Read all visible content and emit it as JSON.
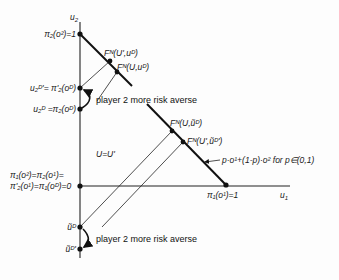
{
  "diagram": {
    "axes": {
      "x_label": "u",
      "x_label_sub": "1",
      "y_label": "u",
      "y_label_sub": "2"
    },
    "y_axis_labels": {
      "top": "π₂(o²)=1",
      "u2D_prime": "u₂ᴰ'= π'₂(oᴰ)",
      "u2D": "u₂ᴰ =π₂(oᴰ)",
      "origin_line1": "π₁(o²)=π₂(o¹)=",
      "origin_line2": "π'₂(o¹)=π₁(oᴰ)=0",
      "utilde_D": "ũᴰ",
      "utilde_D_prime": "ũᴰ'"
    },
    "x_axis_labels": {
      "right_point": "π₁(o¹)=1"
    },
    "points": {
      "FN_Uprime_uD": "Fᴺ(U',uᴰ)",
      "FN_U_uD": "Fᴺ(U,uᴰ)",
      "FN_U_utildeD": "Fᴺ(U,ũᴰ)",
      "FN_Uprime_utildeDprime": "Fᴺ(U',ũᴰ')"
    },
    "annotations": {
      "risk_averse_upper": "player 2 more risk averse",
      "risk_averse_lower": "player 2 more risk averse",
      "U_equals": "U=U'",
      "lottery_line": "p·o¹+(1-p)·o²  for p∈(0,1)"
    },
    "colors": {
      "ink": "#111111",
      "background": "#fdfdfd"
    }
  }
}
